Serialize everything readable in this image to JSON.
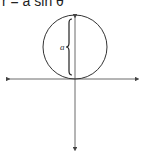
{
  "figure": {
    "equation": "r = a sin θ",
    "label_a": "a",
    "colors": {
      "stroke": "#333333",
      "axis": "#444444",
      "background": "#ffffff"
    },
    "circle": {
      "cx": 75,
      "cy": 47,
      "r": 32
    },
    "axes": {
      "horizontal": {
        "y": 79,
        "x_start": 5,
        "x_end": 140
      },
      "vertical": {
        "x": 75,
        "y_start": 13,
        "y_end": 152
      }
    }
  }
}
